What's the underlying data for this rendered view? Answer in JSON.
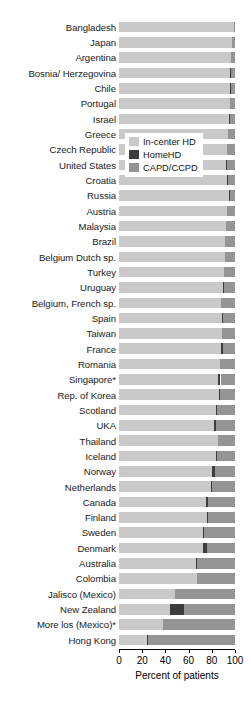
{
  "chart_data": {
    "type": "bar",
    "orientation": "horizontal",
    "stacked": true,
    "title": "",
    "xlabel": "Percent of patients",
    "ylabel": "",
    "xlim": [
      0,
      100
    ],
    "xticks": [
      0,
      20,
      40,
      60,
      80,
      100
    ],
    "xtick_labels": [
      "0",
      "20",
      "40",
      "60",
      "80",
      "100"
    ],
    "grid": true,
    "legend_position": "upper-right-inside",
    "series": [
      {
        "name": "In-center HD",
        "color": "#c9c9c9"
      },
      {
        "name": "HomeHD",
        "color": "#3d3d3d"
      },
      {
        "name": "CAPD/CCPD",
        "color": "#949494"
      }
    ],
    "categories": [
      "Bangladesh",
      "Japan",
      "Argentina",
      "Bosnia/ Herzegovina",
      "Chile",
      "Portugal",
      "Israel",
      "Greece",
      "Czech Republic",
      "United States",
      "Croatia",
      "Russia",
      "Austria",
      "Malaysia",
      "Brazil",
      "Belgium Dutch sp.",
      "Turkey",
      "Uruguay",
      "Belgium, French sp.",
      "Spain",
      "Taiwan",
      "France",
      "Romania",
      "Singapore*",
      "Rep. of Korea",
      "Scotland",
      "UKA",
      "Thailand",
      "Iceland",
      "Norway",
      "Netherlands",
      "Canada",
      "Finland",
      "Sweden",
      "Denmark",
      "Australia",
      "Colombia",
      "Jalisco (Mexico)",
      "New Zealand",
      "More los (Mexico)*",
      "Hong Kong"
    ],
    "values": {
      "In-center HD": [
        99.5,
        97.0,
        96.5,
        96.0,
        96.0,
        95.5,
        95.0,
        94.0,
        93.0,
        92.0,
        93.5,
        95.0,
        93.0,
        92.0,
        91.5,
        91.0,
        90.5,
        90.0,
        88.0,
        89.0,
        88.5,
        88.0,
        87.0,
        85.5,
        86.5,
        84.0,
        82.0,
        85.0,
        84.0,
        80.0,
        79.0,
        75.0,
        76.0,
        72.0,
        72.0,
        66.0,
        67.0,
        48.0,
        44.0,
        38.0,
        24.0
      ],
      "HomeHD": [
        0.0,
        0.3,
        0.3,
        0.3,
        0.3,
        0.3,
        0.3,
        0.3,
        0.3,
        0.8,
        0.3,
        0.3,
        0.3,
        0.3,
        0.3,
        0.3,
        0.3,
        0.3,
        0.3,
        0.3,
        0.3,
        1.5,
        0.3,
        2.0,
        0.3,
        0.3,
        1.2,
        0.3,
        0.3,
        2.5,
        1.5,
        2.0,
        0.5,
        1.5,
        4.0,
        1.0,
        0.0,
        0.0,
        12.0,
        0.0,
        0.7
      ],
      "CAPD/CCPD": [
        0.5,
        2.7,
        3.2,
        3.7,
        3.7,
        4.2,
        4.7,
        5.7,
        6.7,
        7.2,
        6.2,
        4.7,
        6.7,
        7.7,
        8.2,
        8.7,
        9.2,
        9.7,
        11.7,
        10.7,
        11.2,
        10.5,
        12.7,
        12.5,
        13.2,
        15.7,
        16.8,
        14.7,
        15.7,
        17.5,
        19.5,
        23.0,
        23.5,
        26.5,
        24.0,
        33.0,
        33.0,
        52.0,
        44.0,
        62.0,
        75.3
      ]
    }
  },
  "legend": {
    "items": [
      {
        "label": "In-center HD",
        "color": "#c9c9c9"
      },
      {
        "label": "HomeHD",
        "color": "#3d3d3d"
      },
      {
        "label": "CAPD/CCPD",
        "color": "#949494"
      }
    ]
  }
}
